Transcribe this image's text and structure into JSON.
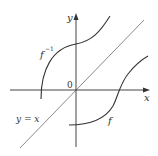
{
  "figure": {
    "labels": {
      "y_axis": "y",
      "x_axis": "x",
      "origin": "0",
      "inverse": "f",
      "inverse_sup": "−1",
      "function": "f",
      "diagonal": "y = x"
    },
    "colors": {
      "curve": "#333333",
      "diagonal": "#8a8a8a",
      "axis": "#444444",
      "background": "#ffffff"
    }
  }
}
